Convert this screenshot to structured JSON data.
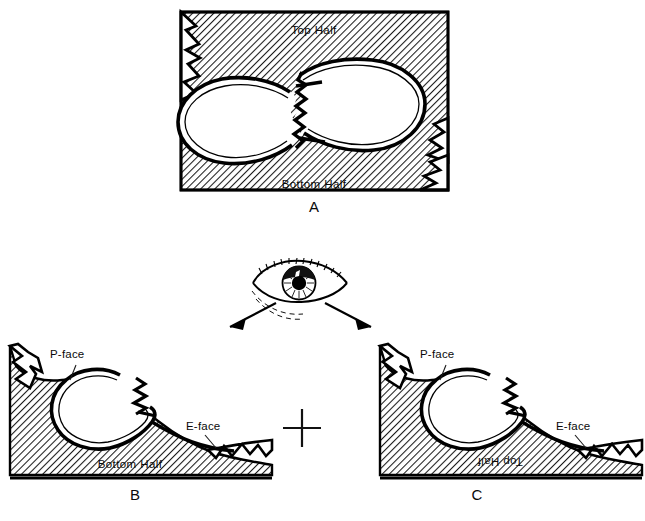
{
  "figure": {
    "panels": [
      {
        "id": "A",
        "letter": "A",
        "labels": {
          "top": "Top Half",
          "bottom": "Bottom Half"
        }
      },
      {
        "id": "B",
        "letter": "B",
        "labels": {
          "p_face": "P-face",
          "e_face": "E-face",
          "half": "Bottom Half"
        }
      },
      {
        "id": "C",
        "letter": "C",
        "labels": {
          "p_face": "P-face",
          "e_face": "E-face",
          "half": "Top Half",
          "half_rotated": true
        }
      }
    ],
    "operator": "+",
    "icons": {
      "eye": "eye-icon",
      "arrow_left": "arrow-down-left-icon",
      "arrow_right": "arrow-down-right-icon"
    },
    "colors": {
      "ink": "#000000",
      "background": "#ffffff",
      "hatch": "#1a1a1a"
    }
  }
}
